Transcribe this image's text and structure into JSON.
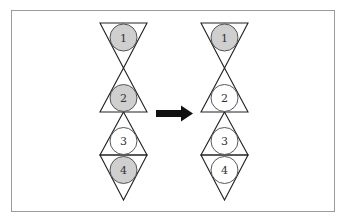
{
  "colors": {
    "shaded": "#cfcfcf",
    "unshaded": "#ffffff",
    "line": "#222222",
    "arrow": "#111111",
    "frame": "#9a9a9a"
  },
  "left_figure": {
    "circles": [
      {
        "label": "1",
        "shaded": true
      },
      {
        "label": "2",
        "shaded": true
      },
      {
        "label": "3",
        "shaded": false
      },
      {
        "label": "4",
        "shaded": true
      }
    ]
  },
  "arrow": {
    "direction": "right"
  },
  "right_figure": {
    "circles": [
      {
        "label": "1",
        "shaded": true
      },
      {
        "label": "2",
        "shaded": false
      },
      {
        "label": "3",
        "shaded": false
      },
      {
        "label": "4",
        "shaded": false
      }
    ]
  }
}
